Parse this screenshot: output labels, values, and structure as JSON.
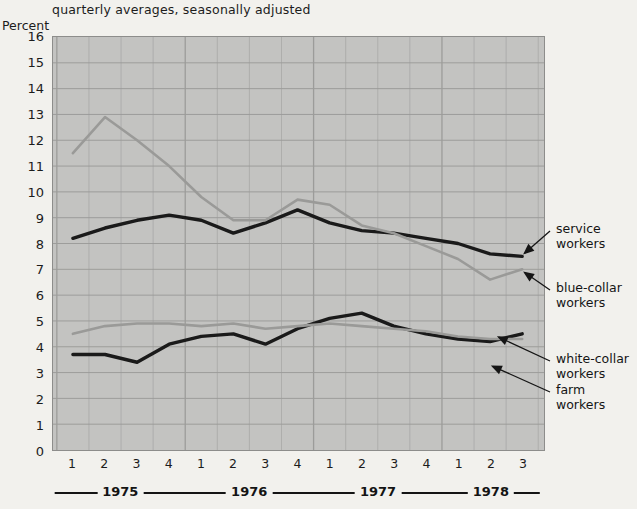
{
  "chart_data": {
    "type": "line",
    "title": "",
    "subtitle": "quarterly averages, seasonally adjusted",
    "ylabel": "Percent",
    "xlabel": "",
    "ylim": [
      0,
      16
    ],
    "ytick_step": 1,
    "grid": true,
    "legend_position": "right-callouts",
    "x": [
      "1975 Q1",
      "1975 Q2",
      "1975 Q3",
      "1975 Q4",
      "1976 Q1",
      "1976 Q2",
      "1976 Q3",
      "1976 Q4",
      "1977 Q1",
      "1977 Q2",
      "1977 Q3",
      "1977 Q4",
      "1978 Q1",
      "1978 Q2",
      "1978 Q3"
    ],
    "quarter_labels": [
      "1",
      "2",
      "3",
      "4",
      "1",
      "2",
      "3",
      "4",
      "1",
      "2",
      "3",
      "4",
      "1",
      "2",
      "3"
    ],
    "year_groups": [
      {
        "label": "1975",
        "start_index": 0,
        "end_index": 3
      },
      {
        "label": "1976",
        "start_index": 4,
        "end_index": 7
      },
      {
        "label": "1977",
        "start_index": 8,
        "end_index": 11
      },
      {
        "label": "1978",
        "start_index": 12,
        "end_index": 14
      }
    ],
    "yticks": [
      0,
      1,
      2,
      3,
      4,
      5,
      6,
      7,
      8,
      9,
      10,
      11,
      12,
      13,
      14,
      15,
      16
    ],
    "series": [
      {
        "name": "service workers",
        "color": "#1a1a1a",
        "width": 3.4,
        "values": [
          8.2,
          8.6,
          8.9,
          9.1,
          8.9,
          8.4,
          8.8,
          9.3,
          8.8,
          8.5,
          8.4,
          8.2,
          8.0,
          7.6,
          7.5
        ]
      },
      {
        "name": "blue-collar workers",
        "color": "#9a9a98",
        "width": 2.6,
        "values": [
          11.5,
          12.9,
          12.0,
          11.0,
          9.8,
          8.9,
          8.9,
          9.7,
          9.5,
          8.7,
          8.4,
          7.9,
          7.4,
          6.6,
          7.0
        ]
      },
      {
        "name": "white-collar workers",
        "color": "#1a1a1a",
        "width": 3.4,
        "values": [
          3.7,
          3.7,
          3.4,
          4.1,
          4.4,
          4.5,
          4.1,
          4.7,
          5.1,
          5.3,
          4.8,
          4.5,
          4.3,
          4.2,
          4.5
        ]
      },
      {
        "name": "farm workers",
        "color": "#9a9a98",
        "width": 2.6,
        "values": [
          4.5,
          4.8,
          4.9,
          4.9,
          4.8,
          4.9,
          4.7,
          4.8,
          4.9,
          4.8,
          4.7,
          4.6,
          4.4,
          4.3,
          4.3
        ]
      }
    ],
    "callouts": [
      {
        "label_line1": "service",
        "label_line2": "workers"
      },
      {
        "label_line1": "blue-collar",
        "label_line2": "workers"
      },
      {
        "label_line1": "white-collar",
        "label_line2": "workers"
      },
      {
        "label_line1": "farm",
        "label_line2": "workers"
      }
    ],
    "colors": {
      "plot_background": "#c3c3c1",
      "page_background": "#f2f1ed",
      "gridline": "#9c9c9a",
      "dark_series": "#1a1a1a",
      "light_series": "#9a9a98"
    }
  }
}
